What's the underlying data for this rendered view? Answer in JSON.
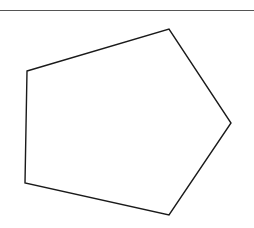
{
  "figure": {
    "shape": "pentagon",
    "stroke_color": "#1a1a1a",
    "fill_color": "#ffffff",
    "vertices": [
      [
        27,
        71
      ],
      [
        169,
        29
      ],
      [
        231,
        123
      ],
      [
        169,
        215
      ],
      [
        25,
        183
      ]
    ]
  },
  "top_rule": {
    "color": "#555555"
  }
}
